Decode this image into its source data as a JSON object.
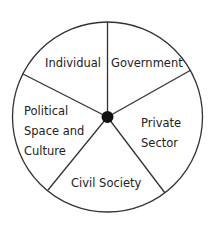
{
  "diagram": {
    "type": "wheel",
    "hub": "center-dot",
    "segments": [
      {
        "label": "Individual"
      },
      {
        "label": "Government"
      },
      {
        "label": "Private Sector",
        "lines": [
          "Private",
          "Sector"
        ]
      },
      {
        "label": "Civil Society"
      },
      {
        "label": "Political Space and Culture",
        "lines": [
          "Political",
          "Space and",
          "Culture"
        ]
      }
    ],
    "colors": {
      "stroke": "#333333",
      "hub": "#111111",
      "text": "#222222",
      "background": "#ffffff"
    }
  }
}
